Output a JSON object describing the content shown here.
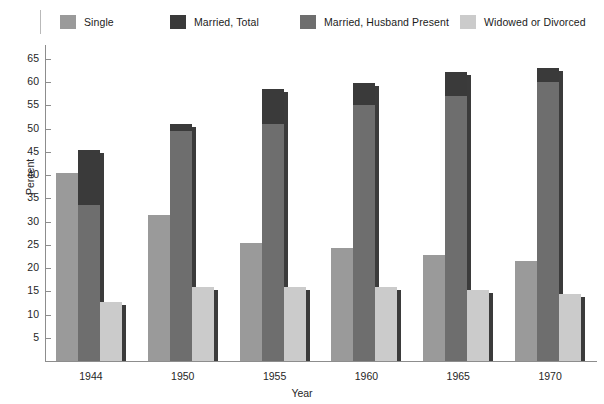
{
  "chart_data": {
    "type": "bar",
    "title": "",
    "xlabel": "Year",
    "ylabel": "Percent",
    "categories": [
      "1944",
      "1950",
      "1955",
      "1960",
      "1965",
      "1970"
    ],
    "ylim": [
      0,
      68
    ],
    "yticks": [
      5,
      10,
      15,
      20,
      25,
      30,
      35,
      40,
      45,
      50,
      55,
      60,
      65
    ],
    "grid": false,
    "legend_position": "top",
    "series": [
      {
        "name": "Single",
        "color": "#9a9a9a",
        "values": [
          40.5,
          31.4,
          25.3,
          24.3,
          22.8,
          21.5
        ]
      },
      {
        "name": "Married, Total",
        "color": "#3a3a3a",
        "values": [
          45.4,
          51.0,
          58.5,
          59.8,
          62.2,
          63.0
        ]
      },
      {
        "name": "Married, Husband Present",
        "color": "#6e6e6e",
        "values": [
          33.5,
          49.5,
          51.0,
          55.0,
          57.0,
          60.0
        ]
      },
      {
        "name": "Widowed or Divorced",
        "color": "#cbcbcb",
        "values": [
          12.7,
          16.0,
          16.0,
          16.0,
          15.2,
          14.5
        ]
      }
    ]
  },
  "legend": {
    "items": [
      {
        "label": "Single",
        "color": "#9a9a9a"
      },
      {
        "label": "Married, Total",
        "color": "#3a3a3a"
      },
      {
        "label": "Married, Husband Present",
        "color": "#6e6e6e"
      },
      {
        "label": "Widowed or Divorced",
        "color": "#cbcbcb"
      }
    ]
  },
  "axes": {
    "y_title": "Percent",
    "x_title": "Year"
  }
}
